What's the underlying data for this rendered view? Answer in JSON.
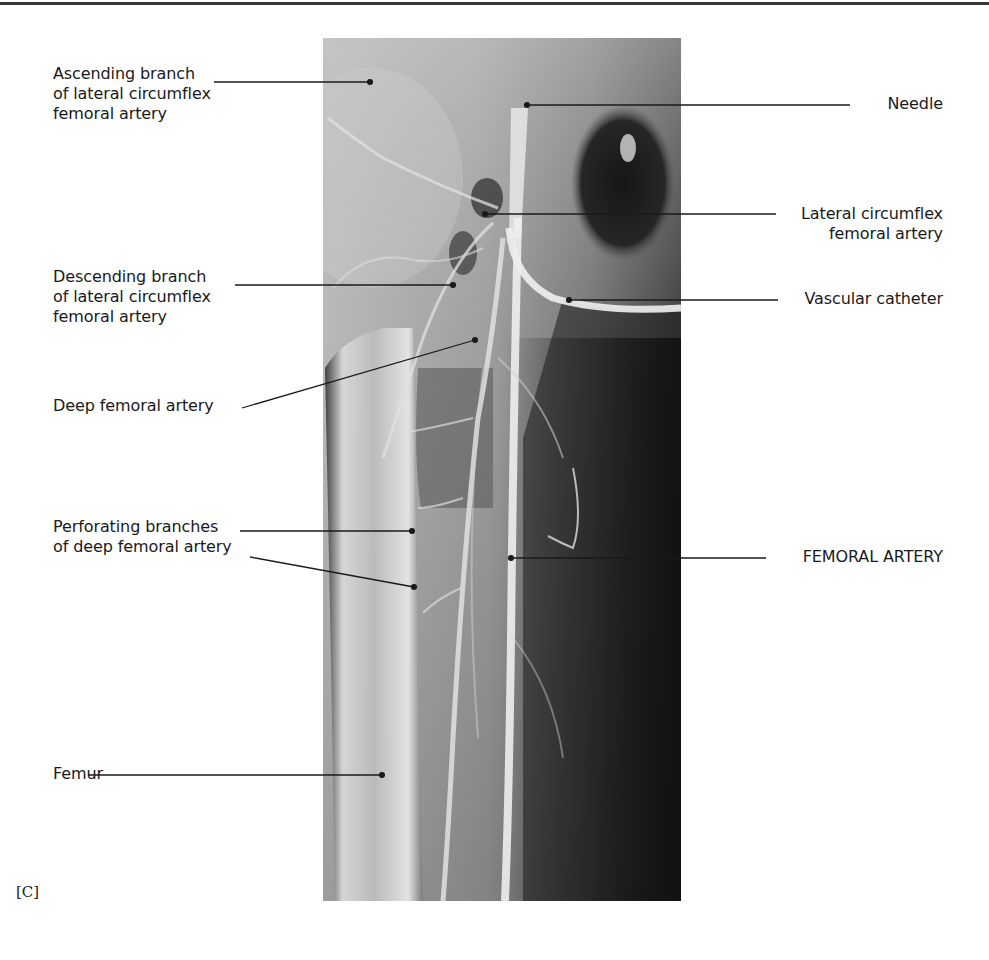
{
  "figure": {
    "panel_letter": "[C]",
    "image_description": "Femoral arteriogram (angiogram) of the thigh",
    "labels_left": [
      {
        "id": "ascending-branch",
        "text": "Ascending branch\nof lateral circumflex\nfemoral artery"
      },
      {
        "id": "descending-branch",
        "text": "Descending branch\nof lateral circumflex\nfemoral artery"
      },
      {
        "id": "deep-femoral",
        "text": "Deep femoral artery"
      },
      {
        "id": "perforating-branches",
        "text": "Perforating branches\nof deep femoral artery"
      },
      {
        "id": "femur",
        "text": "Femur"
      }
    ],
    "labels_right": [
      {
        "id": "needle",
        "text": "Needle"
      },
      {
        "id": "lateral-circumflex",
        "text": "Lateral circumflex\nfemoral artery"
      },
      {
        "id": "vascular-catheter",
        "text": "Vascular catheter"
      },
      {
        "id": "femoral-artery",
        "text": "FEMORAL ARTERY"
      }
    ]
  }
}
